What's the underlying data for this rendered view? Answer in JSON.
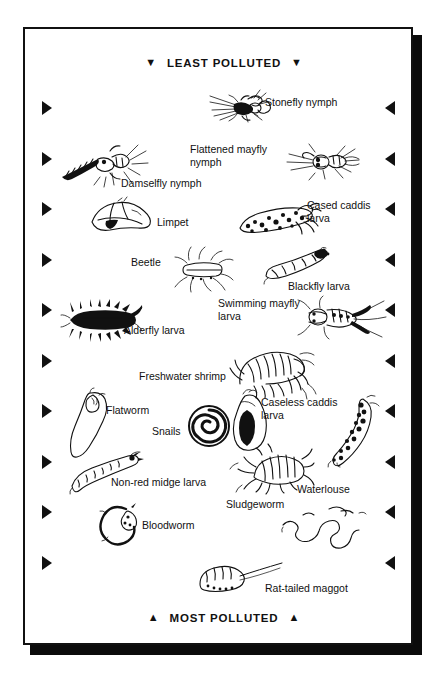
{
  "diagram": {
    "title_top": "LEAST POLLUTED",
    "title_bottom": "MOST POLLUTED",
    "top_marker": "▼",
    "bottom_marker": "▲",
    "frame_color": "#111111",
    "background_color": "#ffffff",
    "side_arrow_left": "▶",
    "side_arrow_right": "◀",
    "side_arrow_rows": 10
  },
  "organisms": [
    {
      "id": "stonefly-nymph",
      "label": "Stonefly nymph"
    },
    {
      "id": "flattened-mayfly-nymph",
      "label": "Flattened mayfly\nnymph"
    },
    {
      "id": "damselfly-nymph",
      "label": "Damselfly nymph"
    },
    {
      "id": "limpet",
      "label": "Limpet"
    },
    {
      "id": "cased-caddis-larva",
      "label": "Cased caddis\nlarva"
    },
    {
      "id": "beetle",
      "label": "Beetle"
    },
    {
      "id": "blackfly-larva",
      "label": "Blackfly larva"
    },
    {
      "id": "swimming-mayfly-larva",
      "label": "Swimming mayfly\nlarva"
    },
    {
      "id": "alderfly-larva",
      "label": "Alderfly larva"
    },
    {
      "id": "freshwater-shrimp",
      "label": "Freshwater shrimp"
    },
    {
      "id": "flatworm",
      "label": "Flatworm"
    },
    {
      "id": "snails",
      "label": "Snails"
    },
    {
      "id": "caseless-caddis-larva",
      "label": "Caseless caddis\nlarva"
    },
    {
      "id": "non-red-midge-larva",
      "label": "Non-red midge larva"
    },
    {
      "id": "waterlouse",
      "label": "Waterlouse"
    },
    {
      "id": "bloodworm",
      "label": "Bloodworm"
    },
    {
      "id": "sludgeworm",
      "label": "Sludgeworm"
    },
    {
      "id": "rat-tailed-maggot",
      "label": "Rat-tailed maggot"
    }
  ]
}
